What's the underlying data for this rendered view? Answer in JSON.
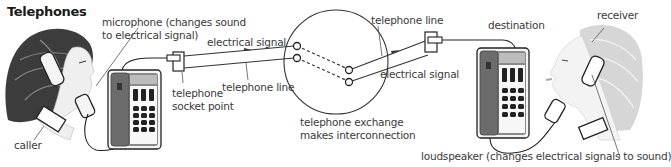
{
  "title": "Telephones",
  "labels": {
    "microphone": "microphone (changes sound",
    "microphone_2": "to electrical signal)",
    "electrical_signal_left": "electrical signal",
    "telephone_line_left": "telephone line",
    "socket_point_1": "telephone",
    "socket_point_2": "socket point",
    "exchange_1": "telephone exchange",
    "exchange_2": "makes interconnection",
    "telephone_line_right": "telephone line",
    "electrical_signal_right": "electrical signal",
    "destination": "destination",
    "receiver": "receiver",
    "caller": "caller",
    "loudspeaker": "loudspeaker (changes electrical signals to sound)"
  },
  "colors": {
    "caller_hair": "#3c3c3c",
    "receiver_hair": "#d6d6d6",
    "phone_body": "#7a7a7a",
    "line": "#333333",
    "text": "#3a3a3a"
  }
}
